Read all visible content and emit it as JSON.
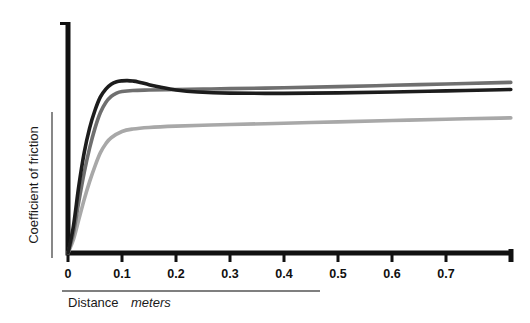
{
  "chart_data": {
    "type": "line",
    "title": "",
    "xlabel": "Distance",
    "xlabel_unit": "meters",
    "ylabel": "Coefficient of friction",
    "xlim": [
      0,
      0.82
    ],
    "ylim": [
      0,
      1.0
    ],
    "grid": false,
    "legend": "none",
    "xticks": [
      "0",
      "0.1",
      "0.2",
      "0.3",
      "0.4",
      "0.5",
      "0.6",
      "0.7"
    ],
    "xtick_values": [
      0,
      0.1,
      0.2,
      0.3,
      0.4,
      0.5,
      0.6,
      0.7
    ],
    "yticks": [],
    "series": [
      {
        "name": "curve-dark",
        "color": "#1c1c1c",
        "width": 3.6,
        "x": [
          0,
          0.01,
          0.02,
          0.03,
          0.04,
          0.05,
          0.06,
          0.07,
          0.08,
          0.09,
          0.1,
          0.11,
          0.12,
          0.13,
          0.15,
          0.17,
          0.2,
          0.24,
          0.3,
          0.4,
          0.5,
          0.6,
          0.7,
          0.8,
          0.82
        ],
        "y": [
          0.0,
          0.12,
          0.3,
          0.45,
          0.56,
          0.64,
          0.7,
          0.735,
          0.757,
          0.768,
          0.772,
          0.773,
          0.771,
          0.767,
          0.755,
          0.744,
          0.731,
          0.722,
          0.717,
          0.716,
          0.718,
          0.722,
          0.727,
          0.732,
          0.733
        ]
      },
      {
        "name": "curve-medium-gray",
        "color": "#6f6f6f",
        "width": 3.6,
        "x": [
          0,
          0.01,
          0.02,
          0.03,
          0.04,
          0.05,
          0.06,
          0.07,
          0.08,
          0.09,
          0.1,
          0.12,
          0.15,
          0.2,
          0.25,
          0.3,
          0.4,
          0.5,
          0.6,
          0.7,
          0.8,
          0.82
        ],
        "y": [
          0.0,
          0.09,
          0.23,
          0.36,
          0.47,
          0.56,
          0.63,
          0.675,
          0.702,
          0.717,
          0.724,
          0.729,
          0.731,
          0.733,
          0.735,
          0.737,
          0.741,
          0.746,
          0.752,
          0.758,
          0.764,
          0.765
        ]
      },
      {
        "name": "curve-light-gray",
        "color": "#a8a8a8",
        "width": 3.6,
        "x": [
          0,
          0.01,
          0.02,
          0.03,
          0.04,
          0.05,
          0.06,
          0.07,
          0.08,
          0.1,
          0.12,
          0.15,
          0.2,
          0.25,
          0.3,
          0.4,
          0.5,
          0.6,
          0.7,
          0.8,
          0.82
        ],
        "y": [
          0.0,
          0.06,
          0.15,
          0.24,
          0.32,
          0.39,
          0.45,
          0.49,
          0.517,
          0.545,
          0.556,
          0.563,
          0.569,
          0.573,
          0.576,
          0.582,
          0.588,
          0.594,
          0.6,
          0.605,
          0.606
        ]
      }
    ]
  },
  "axes": {
    "origin_label": "0",
    "spine_color": "#111111"
  }
}
